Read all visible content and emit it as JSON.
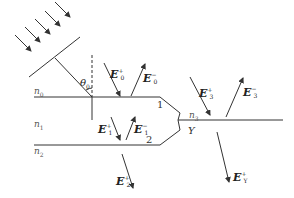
{
  "diagram": {
    "type": "y-branch waveguide / thin film reflection diagram",
    "media": [
      {
        "id": "n0",
        "label": "n",
        "sub": "0"
      },
      {
        "id": "n1",
        "label": "n",
        "sub": "1"
      },
      {
        "id": "n2",
        "label": "n",
        "sub": "2"
      },
      {
        "id": "n3",
        "label": "n",
        "sub": "3"
      }
    ],
    "angle": {
      "label": "θ",
      "sub": "0"
    },
    "branch_labels": [
      "1",
      "2",
      "Y"
    ],
    "fields": [
      {
        "id": "E0p",
        "base": "E",
        "sup": "+",
        "sub": "0",
        "direction": "down"
      },
      {
        "id": "E0m",
        "base": "E",
        "sup": "−",
        "sub": "0",
        "direction": "up"
      },
      {
        "id": "E1p",
        "base": "E",
        "sup": "+",
        "sub": "1",
        "direction": "down"
      },
      {
        "id": "E1m",
        "base": "E",
        "sup": "−",
        "sub": "1",
        "direction": "up"
      },
      {
        "id": "E2p",
        "base": "E",
        "sup": "+",
        "sub": "2",
        "direction": "down"
      },
      {
        "id": "E3p",
        "base": "E",
        "sup": "+",
        "sub": "3",
        "direction": "down"
      },
      {
        "id": "E3m",
        "base": "E",
        "sup": "−",
        "sub": "3",
        "direction": "up"
      },
      {
        "id": "EYp",
        "base": "E",
        "sup": "+",
        "sub": "Y",
        "direction": "down"
      }
    ],
    "colors": {
      "line": "#333333",
      "text": "#222222",
      "background": "#ffffff"
    }
  }
}
